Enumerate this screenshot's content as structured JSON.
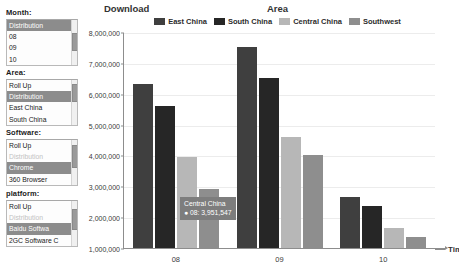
{
  "chart_title": "Download",
  "legend_title": "Area",
  "xaxis_label": "Time",
  "sidebar": {
    "groups": [
      {
        "title": "Month:",
        "items": [
          {
            "label": "Distribution",
            "state": "selected"
          },
          {
            "label": "08",
            "state": "normal"
          },
          {
            "label": "09",
            "state": "normal"
          },
          {
            "label": "10",
            "state": "normal"
          }
        ]
      },
      {
        "title": "Area:",
        "items": [
          {
            "label": "Roll Up",
            "state": "normal"
          },
          {
            "label": "Distribution",
            "state": "selected"
          },
          {
            "label": "East China",
            "state": "normal"
          },
          {
            "label": "South China",
            "state": "normal"
          }
        ]
      },
      {
        "title": "Software:",
        "items": [
          {
            "label": "Roll Up",
            "state": "normal"
          },
          {
            "label": "Distribution",
            "state": "disabled"
          },
          {
            "label": "Chrome",
            "state": "selected"
          },
          {
            "label": "360 Browser",
            "state": "normal"
          }
        ]
      },
      {
        "title": "platform:",
        "items": [
          {
            "label": "Roll Up",
            "state": "normal"
          },
          {
            "label": "Distribution",
            "state": "disabled"
          },
          {
            "label": "Baidu Softwa",
            "state": "selected"
          },
          {
            "label": "2GC Software C",
            "state": "normal"
          }
        ]
      }
    ]
  },
  "tooltip": {
    "title": "Central China",
    "value": "● 08: 3,951,547"
  },
  "colors": {
    "east_china": "#3f3f3f",
    "south_china": "#262626",
    "central_china": "#b7b7b7",
    "southwest": "#8e8e8e",
    "tooltip_bg": "#7d7d7d",
    "axis": "#8d8d8d",
    "grid": "#ececec"
  },
  "chart_data": {
    "type": "bar",
    "title": "Download",
    "legend_title": "Area",
    "xlabel": "Time",
    "ylabel": "",
    "ylim": [
      1000000,
      8000000
    ],
    "ytick_labels": [
      "8,000,000",
      "7,000,000",
      "6,000,000",
      "5,000,000",
      "4,000,000",
      "3,000,000",
      "2,000,000",
      "1,000,000"
    ],
    "ytick_values": [
      8000000,
      7000000,
      6000000,
      5000000,
      4000000,
      3000000,
      2000000,
      1000000
    ],
    "grid": true,
    "legend_position": "top-center",
    "categories": [
      "08",
      "09",
      "10"
    ],
    "series": [
      {
        "name": "East China",
        "color": "#3f3f3f",
        "values": [
          6300000,
          7500000,
          2650000
        ]
      },
      {
        "name": "South China",
        "color": "#262626",
        "values": [
          5600000,
          6500000,
          2350000
        ]
      },
      {
        "name": "Central China",
        "color": "#b7b7b7",
        "values": [
          3951547,
          4600000,
          1650000
        ]
      },
      {
        "name": "Southwest",
        "color": "#8e8e8e",
        "values": [
          2900000,
          4000000,
          1350000
        ]
      }
    ],
    "annotations": [
      {
        "series": "Central China",
        "category": "08",
        "label": "Central China",
        "value_label": "● 08: 3,951,547"
      }
    ]
  }
}
